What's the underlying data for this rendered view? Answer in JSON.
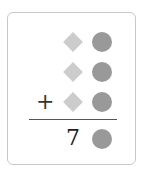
{
  "problem": {
    "rows": [
      {
        "operator": "",
        "shapes": [
          "diamond",
          "circle"
        ]
      },
      {
        "operator": "",
        "shapes": [
          "diamond",
          "circle"
        ]
      },
      {
        "operator": "+",
        "shapes": [
          "diamond",
          "circle"
        ]
      }
    ],
    "result": {
      "digit": "7",
      "shape": "circle"
    }
  },
  "colors": {
    "diamond": "#cccccc",
    "circle": "#999999",
    "border": "#c8c8c8"
  }
}
